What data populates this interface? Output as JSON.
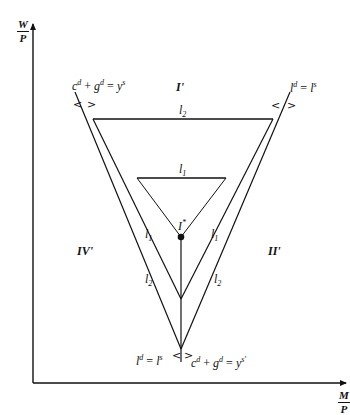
{
  "axes": {
    "y_label_num": "W",
    "y_label_den": "P",
    "x_label_num": "M",
    "x_label_den": "P"
  },
  "regions": {
    "top": "I'",
    "right": "II'",
    "left": "IV'"
  },
  "curves": {
    "goods_market_left": {
      "c": "c",
      "c_sup": "d",
      "g": "g",
      "g_sup": "d",
      "y": "y",
      "y_sup": "s",
      "plus": "+",
      "eq": "="
    },
    "labor_market_right": {
      "l": "l",
      "l_sup": "d",
      "eq": "=",
      "r": "l",
      "r_sup": "s"
    },
    "labor_market_bottom": {
      "l": "l",
      "l_sup": "d",
      "eq": "=",
      "r": "l",
      "r_sup": "s"
    },
    "goods_market_bottom": {
      "c": "c",
      "c_sup": "d",
      "g": "g",
      "g_sup": "d",
      "y": "y",
      "y_sup": "s'",
      "plus": "+",
      "eq": "="
    }
  },
  "inequality_markers": {
    "less": "<",
    "greater": ">"
  },
  "line_labels": {
    "l2_top": {
      "base": "l",
      "sub": "2"
    },
    "l1_top": {
      "base": "l",
      "sub": "1"
    },
    "l1_left": {
      "base": "l",
      "sub": "1"
    },
    "l1_right": {
      "base": "l",
      "sub": "1"
    },
    "l2_left": {
      "base": "l",
      "sub": "2"
    },
    "l2_right": {
      "base": "l",
      "sub": "2"
    }
  },
  "equilibrium": {
    "base": "I",
    "sup": "*"
  }
}
